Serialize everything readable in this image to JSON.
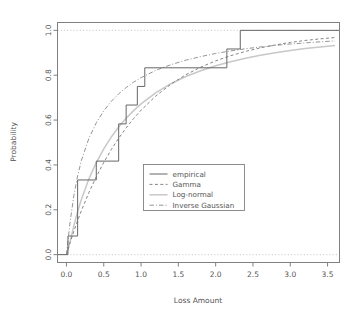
{
  "chart_data": {
    "type": "line",
    "title": "",
    "xlabel": "Loss Amount",
    "ylabel": "Probability",
    "xlim": [
      -0.12,
      3.66
    ],
    "ylim": [
      -0.035,
      1.035
    ],
    "xticks": [
      "0.0",
      "0.5",
      "1.0",
      "1.5",
      "2.0",
      "2.5",
      "3.0",
      "3.5"
    ],
    "xtick_values": [
      0.0,
      0.5,
      1.0,
      1.5,
      2.0,
      2.5,
      3.0,
      3.5
    ],
    "yticks": [
      "0.0",
      "0.2",
      "0.4",
      "0.6",
      "0.8",
      "1.0"
    ],
    "ytick_values": [
      0.0,
      0.2,
      0.4,
      0.6,
      0.8,
      1.0
    ],
    "grid": false,
    "reference_lines": [
      0.0,
      1.0
    ],
    "legend_position": "center",
    "series": [
      {
        "name": "empirical",
        "style": "solid",
        "type": "step",
        "x": [
          -0.12,
          0.02,
          0.02,
          0.15,
          0.15,
          0.4,
          0.4,
          0.7,
          0.7,
          0.8,
          0.8,
          0.95,
          0.95,
          1.05,
          1.05,
          2.15,
          2.15,
          2.33,
          2.33,
          3.66
        ],
        "y": [
          0.0,
          0.0,
          0.083,
          0.083,
          0.333,
          0.333,
          0.417,
          0.417,
          0.583,
          0.583,
          0.667,
          0.667,
          0.75,
          0.75,
          0.833,
          0.833,
          0.917,
          0.917,
          1.0,
          1.0
        ],
        "jump_points": [
          {
            "x": 0.02,
            "y": 0.083
          },
          {
            "x": 0.15,
            "y": 0.333
          },
          {
            "x": 0.4,
            "y": 0.417
          },
          {
            "x": 0.7,
            "y": 0.583
          },
          {
            "x": 0.8,
            "y": 0.667
          },
          {
            "x": 0.95,
            "y": 0.75
          },
          {
            "x": 1.05,
            "y": 0.833
          },
          {
            "x": 2.15,
            "y": 0.917
          },
          {
            "x": 2.33,
            "y": 1.0
          }
        ]
      },
      {
        "name": "Gamma",
        "style": "dashed",
        "type": "curve",
        "x": [
          0.0,
          0.05,
          0.1,
          0.15,
          0.2,
          0.3,
          0.4,
          0.5,
          0.6,
          0.7,
          0.8,
          0.9,
          1.0,
          1.2,
          1.4,
          1.6,
          1.8,
          2.0,
          2.2,
          2.4,
          2.6,
          2.8,
          3.0,
          3.2,
          3.4,
          3.6
        ],
        "y": [
          0.0,
          0.055,
          0.105,
          0.152,
          0.196,
          0.276,
          0.347,
          0.411,
          0.468,
          0.519,
          0.565,
          0.607,
          0.644,
          0.708,
          0.76,
          0.802,
          0.836,
          0.864,
          0.887,
          0.906,
          0.922,
          0.935,
          0.946,
          0.955,
          0.962,
          0.968
        ]
      },
      {
        "name": "Log-normal",
        "style": "light-solid",
        "type": "curve",
        "x": [
          0.0,
          0.05,
          0.1,
          0.15,
          0.2,
          0.3,
          0.4,
          0.5,
          0.6,
          0.7,
          0.8,
          0.9,
          1.0,
          1.2,
          1.4,
          1.6,
          1.8,
          2.0,
          2.2,
          2.4,
          2.6,
          2.8,
          3.0,
          3.2,
          3.4,
          3.6
        ],
        "y": [
          0.0,
          0.06,
          0.13,
          0.192,
          0.246,
          0.337,
          0.41,
          0.472,
          0.524,
          0.569,
          0.608,
          0.642,
          0.672,
          0.722,
          0.762,
          0.794,
          0.82,
          0.842,
          0.86,
          0.876,
          0.889,
          0.9,
          0.91,
          0.919,
          0.926,
          0.933
        ]
      },
      {
        "name": "Inverse Gaussian",
        "style": "dashdot",
        "type": "curve",
        "x": [
          0.0,
          0.05,
          0.1,
          0.15,
          0.2,
          0.3,
          0.4,
          0.5,
          0.6,
          0.7,
          0.8,
          0.9,
          1.0,
          1.2,
          1.4,
          1.6,
          1.8,
          2.0,
          2.2,
          2.4,
          2.6,
          2.8,
          3.0,
          3.2,
          3.4,
          3.6
        ],
        "y": [
          0.0,
          0.148,
          0.265,
          0.352,
          0.419,
          0.518,
          0.588,
          0.641,
          0.683,
          0.717,
          0.745,
          0.769,
          0.789,
          0.822,
          0.847,
          0.867,
          0.883,
          0.897,
          0.908,
          0.918,
          0.926,
          0.933,
          0.939,
          0.944,
          0.949,
          0.953
        ]
      }
    ]
  },
  "legend": {
    "items": [
      {
        "label": "empirical",
        "style": "solid"
      },
      {
        "label": "Gamma",
        "style": "dashed"
      },
      {
        "label": "Log-normal",
        "style": "light-solid"
      },
      {
        "label": "Inverse Gaussian",
        "style": "dashdot"
      }
    ]
  },
  "colors": {
    "axis": "#808080",
    "empirical": "#666666",
    "gamma": "#777777",
    "lognormal": "#c8c8c8",
    "inverse_gaussian": "#888888",
    "reference": "#bbbbbb",
    "text": "#555555",
    "background": "#ffffff"
  }
}
